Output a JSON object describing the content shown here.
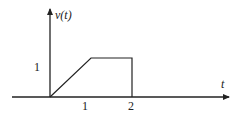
{
  "chart_data": {
    "type": "line",
    "title": "",
    "xlabel": "t",
    "ylabel": "v(t)",
    "x": [
      0,
      1,
      2,
      2
    ],
    "values": [
      0,
      1,
      1,
      0
    ],
    "x_ticks": [
      "1",
      "2"
    ],
    "y_ticks": [
      "1"
    ],
    "xlim": [
      -1,
      2.9
    ],
    "ylim": [
      0,
      2.3
    ],
    "grid": false,
    "line_color": "#222222"
  },
  "labels": {
    "y_axis": "v(t)",
    "x_axis": "t",
    "y_tick_1": "1",
    "x_tick_1": "1",
    "x_tick_2": "2"
  }
}
